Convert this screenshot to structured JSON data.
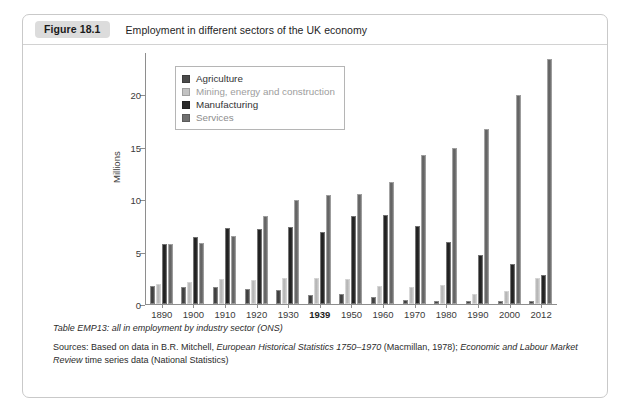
{
  "figure": {
    "badge": "Figure 18.1",
    "title": "Employment in different sectors of the UK economy"
  },
  "legend": {
    "items": [
      {
        "label": "Agriculture",
        "color": "#4a4a4a"
      },
      {
        "label": "Mining, energy and construction",
        "color": "#c2c2c2"
      },
      {
        "label": "Manufacturing",
        "color": "#2a2a2a"
      },
      {
        "label": "Services",
        "color": "#6f6f6f"
      }
    ]
  },
  "caption": {
    "table_note": "Table EMP13: all in employment by industry sector (ONS)",
    "sources_prefix": "Sources: Based on data in B.R. Mitchell, ",
    "sources_italic1": "European Historical Statistics 1750–1970",
    "sources_mid": " (Macmillan, 1978); ",
    "sources_italic2": "Economic and Labour Market Review",
    "sources_suffix": " time series data (National Statistics)"
  },
  "chart_data": {
    "type": "bar",
    "title": "Employment in different sectors of the UK economy",
    "xlabel": "",
    "ylabel": "Millions",
    "ylim": [
      0,
      24
    ],
    "yticks": [
      0,
      5,
      10,
      15,
      20
    ],
    "grid": false,
    "legend_position": "top-left-inside",
    "categories": [
      "1890",
      "1900",
      "1910",
      "1920",
      "1930",
      "1939",
      "1950",
      "1960",
      "1970",
      "1980",
      "1990",
      "2000",
      "2012"
    ],
    "highlighted_category": "1939",
    "series": [
      {
        "name": "Agriculture",
        "color": "#4a4a4a",
        "values": [
          1.7,
          1.6,
          1.6,
          1.4,
          1.3,
          0.9,
          0.95,
          0.65,
          0.4,
          0.3,
          0.28,
          0.25,
          0.25
        ]
      },
      {
        "name": "Mining, energy and construction",
        "color": "#c2c2c2",
        "values": [
          1.9,
          2.1,
          2.4,
          2.25,
          2.5,
          2.5,
          2.35,
          1.7,
          1.65,
          1.8,
          0.95,
          1.25,
          2.5
        ]
      },
      {
        "name": "Manufacturing",
        "color": "#2a2a2a",
        "values": [
          5.7,
          6.4,
          7.2,
          7.1,
          7.3,
          6.9,
          8.4,
          8.5,
          7.4,
          5.95,
          4.7,
          3.8,
          2.8
        ]
      },
      {
        "name": "Services",
        "color": "#6f6f6f",
        "values": [
          5.75,
          5.8,
          6.5,
          8.4,
          9.9,
          10.4,
          10.5,
          11.6,
          14.2,
          14.9,
          16.7,
          19.9,
          23.3
        ]
      }
    ]
  }
}
